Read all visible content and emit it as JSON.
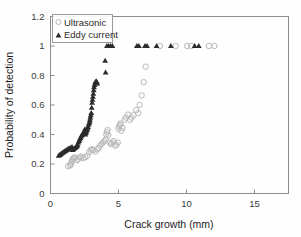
{
  "chart_data": {
    "type": "scatter",
    "title": "",
    "xlabel": "Crack growth (mm)",
    "ylabel": "Probability of detection",
    "xlim": [
      0,
      17.5
    ],
    "ylim": [
      0,
      1.2
    ],
    "xticks": [
      0,
      5,
      10,
      15
    ],
    "xtick_labels": [
      "0",
      "5",
      "10",
      "15"
    ],
    "yticks": [
      0,
      0.2,
      0.4,
      0.6,
      0.8,
      1,
      1.2
    ],
    "ytick_labels": [
      "0",
      "0.2",
      "0.4",
      "0.6",
      "0.8",
      "1",
      "1.2"
    ],
    "grid": false,
    "legend_position": "upper-left-inside",
    "series": [
      {
        "name": "Ultrasonic",
        "marker": "open-circle",
        "color": "#b9b9b9",
        "points": [
          [
            1.3,
            0.185
          ],
          [
            1.45,
            0.19
          ],
          [
            1.5,
            0.2
          ],
          [
            1.55,
            0.215
          ],
          [
            1.6,
            0.225
          ],
          [
            1.65,
            0.235
          ],
          [
            1.72,
            0.24
          ],
          [
            1.8,
            0.245
          ],
          [
            1.95,
            0.225
          ],
          [
            2.05,
            0.235
          ],
          [
            2.15,
            0.245
          ],
          [
            2.25,
            0.25
          ],
          [
            2.4,
            0.24
          ],
          [
            2.55,
            0.245
          ],
          [
            2.7,
            0.255
          ],
          [
            2.85,
            0.28
          ],
          [
            2.95,
            0.295
          ],
          [
            3.05,
            0.3
          ],
          [
            3.15,
            0.295
          ],
          [
            3.3,
            0.285
          ],
          [
            3.45,
            0.3
          ],
          [
            3.55,
            0.31
          ],
          [
            3.65,
            0.325
          ],
          [
            3.75,
            0.335
          ],
          [
            3.85,
            0.345
          ],
          [
            3.95,
            0.355
          ],
          [
            4.05,
            0.365
          ],
          [
            4.1,
            0.4
          ],
          [
            4.15,
            0.415
          ],
          [
            4.2,
            0.43
          ],
          [
            4.25,
            0.395
          ],
          [
            4.35,
            0.345
          ],
          [
            4.45,
            0.335
          ],
          [
            4.55,
            0.345
          ],
          [
            4.65,
            0.355
          ],
          [
            4.75,
            0.325
          ],
          [
            4.85,
            0.33
          ],
          [
            4.95,
            0.345
          ],
          [
            5.0,
            0.44
          ],
          [
            5.05,
            0.455
          ],
          [
            5.1,
            0.465
          ],
          [
            5.15,
            0.475
          ],
          [
            5.2,
            0.425
          ],
          [
            5.3,
            0.445
          ],
          [
            5.45,
            0.5
          ],
          [
            5.55,
            0.515
          ],
          [
            5.7,
            0.535
          ],
          [
            5.85,
            0.5
          ],
          [
            5.95,
            0.515
          ],
          [
            6.1,
            0.53
          ],
          [
            6.3,
            0.565
          ],
          [
            6.45,
            0.545
          ],
          [
            6.55,
            0.6
          ],
          [
            6.7,
            0.665
          ],
          [
            6.85,
            0.755
          ],
          [
            7.0,
            0.86
          ],
          [
            8.05,
            1.0
          ],
          [
            9.2,
            1.0
          ],
          [
            10.05,
            1.0
          ],
          [
            10.35,
            1.0
          ],
          [
            11.65,
            1.0
          ],
          [
            12.05,
            1.0
          ]
        ]
      },
      {
        "name": "Eddy current",
        "marker": "filled-triangle",
        "color": "#2b2b2b",
        "points": [
          [
            0.6,
            0.255
          ],
          [
            0.68,
            0.26
          ],
          [
            0.75,
            0.265
          ],
          [
            0.82,
            0.27
          ],
          [
            0.9,
            0.275
          ],
          [
            0.98,
            0.28
          ],
          [
            1.05,
            0.285
          ],
          [
            1.12,
            0.29
          ],
          [
            1.2,
            0.295
          ],
          [
            1.28,
            0.3
          ],
          [
            1.35,
            0.305
          ],
          [
            1.42,
            0.305
          ],
          [
            1.5,
            0.31
          ],
          [
            1.58,
            0.315
          ],
          [
            1.62,
            0.295
          ],
          [
            1.68,
            0.3
          ],
          [
            1.75,
            0.305
          ],
          [
            1.82,
            0.31
          ],
          [
            1.88,
            0.315
          ],
          [
            1.95,
            0.32
          ],
          [
            2.0,
            0.33
          ],
          [
            2.05,
            0.345
          ],
          [
            2.1,
            0.355
          ],
          [
            2.15,
            0.365
          ],
          [
            2.2,
            0.375
          ],
          [
            2.25,
            0.385
          ],
          [
            2.3,
            0.395
          ],
          [
            2.35,
            0.4
          ],
          [
            2.4,
            0.405
          ],
          [
            2.45,
            0.415
          ],
          [
            2.5,
            0.425
          ],
          [
            2.53,
            0.435
          ],
          [
            2.56,
            0.4
          ],
          [
            2.6,
            0.41
          ],
          [
            2.64,
            0.42
          ],
          [
            2.68,
            0.43
          ],
          [
            2.72,
            0.44
          ],
          [
            2.76,
            0.45
          ],
          [
            2.8,
            0.465
          ],
          [
            2.84,
            0.475
          ],
          [
            2.88,
            0.485
          ],
          [
            2.9,
            0.5
          ],
          [
            2.93,
            0.515
          ],
          [
            2.96,
            0.53
          ],
          [
            3.0,
            0.545
          ],
          [
            3.03,
            0.58
          ],
          [
            3.06,
            0.615
          ],
          [
            3.09,
            0.635
          ],
          [
            3.12,
            0.655
          ],
          [
            3.15,
            0.675
          ],
          [
            3.18,
            0.7
          ],
          [
            3.2,
            0.72
          ],
          [
            3.24,
            0.735
          ],
          [
            3.28,
            0.75
          ],
          [
            3.32,
            0.755
          ],
          [
            3.36,
            0.76
          ],
          [
            3.4,
            0.755
          ],
          [
            3.44,
            0.745
          ],
          [
            4.05,
            0.82
          ],
          [
            4.02,
            0.9
          ],
          [
            4.15,
            1.0
          ],
          [
            4.28,
            1.0
          ],
          [
            4.42,
            1.0
          ],
          [
            4.55,
            1.0
          ],
          [
            6.35,
            1.0
          ],
          [
            6.5,
            1.0
          ],
          [
            6.95,
            1.0
          ],
          [
            7.1,
            1.0
          ],
          [
            7.8,
            1.0
          ],
          [
            8.85,
            1.0
          ],
          [
            10.6,
            1.0
          ],
          [
            10.9,
            1.0
          ]
        ]
      }
    ]
  },
  "legend": {
    "entries": [
      {
        "label": "Ultrasonic",
        "marker": "open-circle"
      },
      {
        "label": "Eddy current",
        "marker": "filled-triangle"
      }
    ]
  },
  "colors": {
    "ultrasonic": "#b9b9b9",
    "eddy_current": "#2b2b2b",
    "axis": "#8c8c8c",
    "text": "#1d1d1d",
    "background": "#fefefe"
  }
}
